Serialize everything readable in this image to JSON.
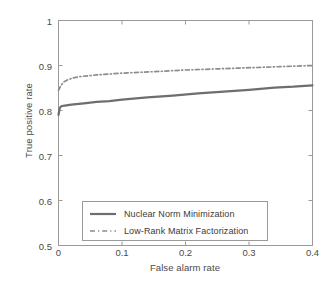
{
  "chart_data": {
    "type": "line",
    "title": "",
    "xlabel": "False alarm rate",
    "ylabel": "True positive rate",
    "xlim": [
      0,
      0.4
    ],
    "ylim": [
      0.5,
      1
    ],
    "xticks": [
      "0",
      "0.1",
      "0.2",
      "0.3",
      "0.4"
    ],
    "xtick_values": [
      0,
      0.1,
      0.2,
      0.3,
      0.4
    ],
    "yticks": [
      "0.5",
      "0.6",
      "0.7",
      "0.8",
      "0.9",
      "1"
    ],
    "ytick_values": [
      0.5,
      0.6,
      0.7,
      0.8,
      0.9,
      1.0
    ],
    "grid": false,
    "legend_position": "lower left",
    "series": [
      {
        "name": "Nuclear Norm Minimization",
        "style": "solid",
        "color": "#6e6e6e",
        "x": [
          0.0,
          0.002,
          0.005,
          0.01,
          0.02,
          0.04,
          0.06,
          0.08,
          0.1,
          0.14,
          0.18,
          0.22,
          0.26,
          0.3,
          0.34,
          0.37,
          0.4
        ],
        "y": [
          0.79,
          0.806,
          0.81,
          0.811,
          0.813,
          0.816,
          0.819,
          0.821,
          0.824,
          0.829,
          0.833,
          0.838,
          0.842,
          0.846,
          0.851,
          0.853,
          0.856
        ]
      },
      {
        "name": "Low-Rank Matrix Factorization",
        "style": "dashdot",
        "color": "#8c8c8c",
        "x": [
          0.0,
          0.004,
          0.008,
          0.014,
          0.022,
          0.032,
          0.045,
          0.06,
          0.08,
          0.1,
          0.13,
          0.16,
          0.2,
          0.24,
          0.28,
          0.32,
          0.36,
          0.4
        ],
        "y": [
          0.845,
          0.856,
          0.863,
          0.868,
          0.872,
          0.875,
          0.877,
          0.879,
          0.881,
          0.883,
          0.885,
          0.887,
          0.89,
          0.892,
          0.894,
          0.896,
          0.898,
          0.9
        ]
      }
    ]
  },
  "legend": {
    "items": [
      {
        "label": "Nuclear Norm Minimization",
        "style": "solid"
      },
      {
        "label": "Low-Rank Matrix Factorization",
        "style": "dashdot"
      }
    ]
  },
  "axes": {
    "frame_color": "#9a9a9a",
    "text_color": "#4a4a4a"
  }
}
